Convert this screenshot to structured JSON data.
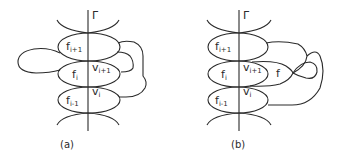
{
  "figure": {
    "panels": [
      {
        "id": "a",
        "caption": "(a)",
        "curve_label": "Γ",
        "faces": [
          {
            "base": "f",
            "sub": "i+1"
          },
          {
            "base": "f",
            "sub": "i"
          },
          {
            "base": "f",
            "sub": "i-1"
          }
        ],
        "vertices": [
          {
            "base": "v",
            "sub": "i+1"
          },
          {
            "base": "v",
            "sub": "i"
          }
        ]
      },
      {
        "id": "b",
        "caption": "(b)",
        "curve_label": "Γ",
        "faces": [
          {
            "base": "f",
            "sub": "i+1"
          },
          {
            "base": "f",
            "sub": "i"
          },
          {
            "base": "f",
            "sub": "i-1"
          }
        ],
        "extra_face": "f",
        "vertices": [
          {
            "base": "v",
            "sub": "i+1"
          },
          {
            "base": "v",
            "sub": "i"
          }
        ]
      }
    ],
    "line_color": "#2a2a2a",
    "background": "#ffffff"
  }
}
